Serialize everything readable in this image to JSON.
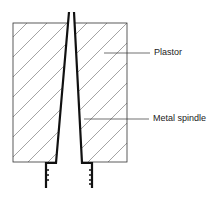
{
  "diagram": {
    "type": "cross-section",
    "labels": [
      {
        "id": "plaster",
        "text": "Plastor"
      },
      {
        "id": "metal_spindle",
        "text": "Metal spindle"
      }
    ],
    "colors": {
      "outline": "#222222",
      "hatch": "#555555",
      "spindle": "#111111",
      "background": "#ffffff"
    }
  }
}
